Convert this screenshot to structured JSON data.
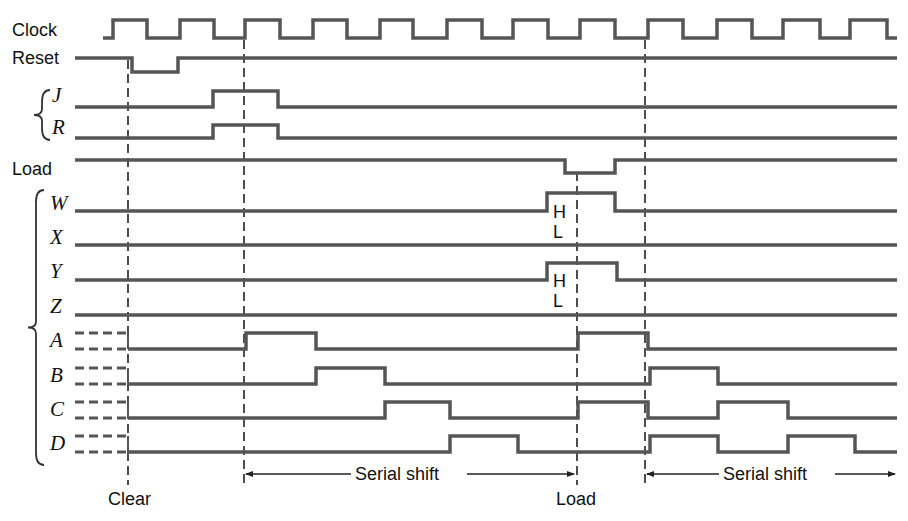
{
  "signals": [
    {
      "id": "clock",
      "label": "Clock",
      "style": "sans",
      "label_x": 12,
      "label_y": 36,
      "low_y": 38,
      "high_y": 20,
      "start_x": 103,
      "end_x": 897,
      "initial": 0,
      "edges": [
        113,
        147,
        180,
        214,
        245,
        280,
        313,
        347,
        380,
        413,
        447,
        482,
        513,
        548,
        580,
        615,
        648,
        683,
        717,
        752,
        783,
        820,
        850,
        887
      ]
    },
    {
      "id": "reset",
      "label": "Reset",
      "style": "sans",
      "label_x": 12,
      "label_y": 64,
      "low_y": 72,
      "high_y": 58,
      "start_x": 75,
      "end_x": 897,
      "initial": 1,
      "edges": [
        132,
        178
      ]
    },
    {
      "id": "j",
      "label": "J",
      "style": "ital",
      "label_x": 52,
      "label_y": 102,
      "low_y": 107,
      "high_y": 91,
      "start_x": 75,
      "end_x": 897,
      "initial": 0,
      "edges": [
        213,
        278
      ]
    },
    {
      "id": "r",
      "label": "R",
      "style": "ital",
      "label_x": 52,
      "label_y": 134,
      "low_y": 138,
      "high_y": 125,
      "start_x": 75,
      "end_x": 897,
      "initial": 0,
      "edges": [
        213,
        278
      ]
    },
    {
      "id": "load",
      "label": "Load",
      "style": "sans",
      "label_x": 12,
      "label_y": 175,
      "low_y": 173,
      "high_y": 160,
      "start_x": 75,
      "end_x": 897,
      "initial": 1,
      "edges": [
        565,
        615
      ]
    },
    {
      "id": "w",
      "label": "W",
      "style": "ital",
      "label_x": 50,
      "label_y": 210,
      "low_y": 211,
      "high_y": 193,
      "start_x": 75,
      "end_x": 897,
      "initial": 0,
      "edges": [
        547,
        615
      ]
    },
    {
      "id": "x",
      "label": "X",
      "style": "ital",
      "label_x": 50,
      "label_y": 244,
      "low_y": 245,
      "high_y": 228,
      "start_x": 75,
      "end_x": 897,
      "initial": 0,
      "edges": []
    },
    {
      "id": "y",
      "label": "Y",
      "style": "ital",
      "label_x": 50,
      "label_y": 278,
      "low_y": 280,
      "high_y": 263,
      "start_x": 75,
      "end_x": 897,
      "initial": 0,
      "edges": [
        547,
        617
      ]
    },
    {
      "id": "z",
      "label": "Z",
      "style": "ital",
      "label_x": 50,
      "label_y": 313,
      "low_y": 315,
      "high_y": 298,
      "start_x": 75,
      "end_x": 897,
      "initial": 0,
      "edges": []
    },
    {
      "id": "a",
      "label": "A",
      "style": "ital",
      "label_x": 50,
      "label_y": 347,
      "low_y": 349,
      "high_y": 333,
      "start_x": 128,
      "end_x": 897,
      "initial": 0,
      "edges": [
        246,
        316,
        578,
        648
      ],
      "unknown_stub": true
    },
    {
      "id": "b",
      "label": "B",
      "style": "ital",
      "label_x": 50,
      "label_y": 382,
      "low_y": 384,
      "high_y": 368,
      "start_x": 128,
      "end_x": 897,
      "initial": 0,
      "edges": [
        316,
        385,
        650,
        718
      ],
      "unknown_stub": true
    },
    {
      "id": "c",
      "label": "C",
      "style": "ital",
      "label_x": 50,
      "label_y": 416,
      "low_y": 418,
      "high_y": 402,
      "start_x": 128,
      "end_x": 897,
      "initial": 0,
      "edges": [
        385,
        450,
        578,
        648,
        718,
        788
      ],
      "unknown_stub": true
    },
    {
      "id": "d",
      "label": "D",
      "style": "ital",
      "label_x": 50,
      "label_y": 450,
      "low_y": 452,
      "high_y": 436,
      "start_x": 128,
      "end_x": 897,
      "initial": 0,
      "edges": [
        450,
        518,
        650,
        718,
        788,
        855
      ],
      "unknown_stub": true
    }
  ],
  "brace_groups": [
    {
      "id": "jr",
      "top": 90,
      "bottom": 140,
      "x": 42
    },
    {
      "id": "inputs",
      "top": 190,
      "bottom": 465,
      "x": 36
    }
  ],
  "hl_annotations": [
    {
      "signal": "w",
      "h_label": "H",
      "l_label": "L",
      "x": 553,
      "h_y": 218,
      "l_y": 238
    },
    {
      "signal": "y",
      "h_label": "H",
      "l_label": "L",
      "x": 553,
      "h_y": 287,
      "l_y": 307
    }
  ],
  "markers": [
    {
      "id": "clear",
      "x": 128,
      "top": 60,
      "bottom": 485,
      "label": "Clear",
      "label_x": 108,
      "label_y": 505
    },
    {
      "id": "shift1",
      "x": 244,
      "top": 40,
      "bottom": 485,
      "label": "",
      "label_x": 0,
      "label_y": 0
    },
    {
      "id": "load",
      "x": 577,
      "top": 172,
      "bottom": 485,
      "label": "Load",
      "label_x": 556,
      "label_y": 505
    },
    {
      "id": "shift2",
      "x": 645,
      "top": 40,
      "bottom": 485,
      "label": "",
      "label_x": 0,
      "label_y": 0
    }
  ],
  "spans": [
    {
      "id": "serial-shift-1",
      "label": "Serial shift",
      "x1": 244,
      "x2": 576,
      "y": 474,
      "text_x": 355,
      "arrow_end": "right"
    },
    {
      "id": "serial-shift-2",
      "label": "Serial shift",
      "x1": 645,
      "x2": 897,
      "y": 474,
      "text_x": 723,
      "arrow_end": "right"
    }
  ],
  "colors": {
    "trace": "#555555",
    "marker": "#222222",
    "text": "#111111",
    "background": "#ffffff"
  }
}
